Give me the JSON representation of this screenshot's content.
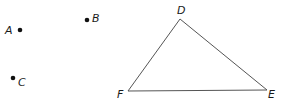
{
  "diagram": {
    "points": [
      {
        "label": "A",
        "dot": [
          20,
          30
        ],
        "label_pos": [
          5,
          34
        ]
      },
      {
        "label": "B",
        "dot": [
          87,
          20
        ],
        "label_pos": [
          92,
          22
        ]
      },
      {
        "label": "C",
        "dot": [
          13,
          78
        ],
        "label_pos": [
          18,
          86
        ]
      }
    ],
    "triangle": {
      "vertices": [
        {
          "label": "D",
          "pos": [
            180,
            19
          ],
          "label_pos": [
            177,
            14
          ]
        },
        {
          "label": "E",
          "pos": [
            267,
            90
          ],
          "label_pos": [
            268,
            98
          ]
        },
        {
          "label": "F",
          "pos": [
            128,
            91
          ],
          "label_pos": [
            117,
            98
          ]
        }
      ]
    },
    "stroke_color": "#555555",
    "dot_color": "#111111"
  }
}
